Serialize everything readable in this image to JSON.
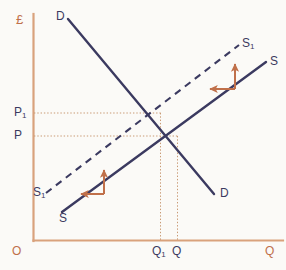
{
  "figure": {
    "type": "supply-demand-diagram",
    "background_color": "#fbfaf7",
    "axis_color": "#d9a27c",
    "curve_color": "#3b3a60",
    "arrow_color": "#c0704a",
    "guide_color": "#c99a74"
  },
  "axes": {
    "y_axis_label": "£",
    "x_axis_label": "Q",
    "origin_label": "O"
  },
  "price_ticks": [
    {
      "id": "p1",
      "label": "P",
      "sub": "1"
    },
    {
      "id": "p",
      "label": "P",
      "sub": ""
    }
  ],
  "quantity_ticks": [
    {
      "id": "q1",
      "label": "Q",
      "sub": "1"
    },
    {
      "id": "q",
      "label": "Q",
      "sub": ""
    }
  ],
  "curves": [
    {
      "id": "demand",
      "name": "demand-curve",
      "style": "solid",
      "label_top": "D",
      "label_bottom": "D"
    },
    {
      "id": "supply",
      "name": "supply-curve",
      "style": "solid",
      "label_top": "S",
      "label_bottom": "S"
    },
    {
      "id": "supply-shift",
      "name": "shifted-supply-curve",
      "style": "dashed",
      "label_top": "S",
      "label_top_sub": "1",
      "label_bottom": "S",
      "label_bottom_sub": "1"
    }
  ],
  "curve_labels": {
    "demand_top": "D",
    "demand_bottom": "D",
    "supply_top": "S",
    "supply_bottom": "S",
    "supply1_top": "S",
    "supply1_top_sub": "1",
    "supply1_bottom": "S",
    "supply1_bottom_sub": "1"
  },
  "shift_arrows": [
    {
      "id": "upper",
      "name": "supply-shift-arrow-upper",
      "directions": [
        "up",
        "left"
      ],
      "meaning": "supply curve shifts up and to the left"
    },
    {
      "id": "lower",
      "name": "supply-shift-arrow-lower",
      "directions": [
        "up",
        "left"
      ],
      "meaning": "supply curve shifts up and to the left"
    }
  ],
  "equilibria": [
    {
      "id": "original",
      "price_label": "P",
      "quantity_label": "Q",
      "x_px": 177,
      "y_px": 136
    },
    {
      "id": "new",
      "price_label": "P1",
      "quantity_label": "Q1",
      "x_px": 160,
      "y_px": 113
    }
  ]
}
